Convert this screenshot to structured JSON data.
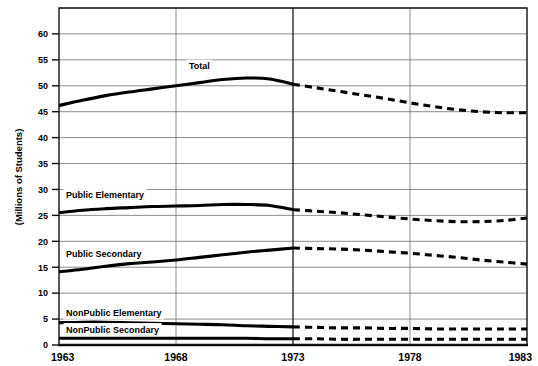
{
  "chart_data": {
    "type": "line",
    "title": "",
    "xlabel": "",
    "ylabel": "(Millions of Students)",
    "xlim": [
      1963,
      1983
    ],
    "ylim": [
      0,
      65
    ],
    "grid": true,
    "legend_position": "inline-labels",
    "x": [
      1963,
      1964,
      1965,
      1966,
      1967,
      1968,
      1969,
      1970,
      1971,
      1972,
      1973,
      1974,
      1975,
      1976,
      1977,
      1978,
      1979,
      1980,
      1981,
      1982,
      1983
    ],
    "xticks": [
      "1963",
      "1968",
      "1973",
      "1978",
      "1983"
    ],
    "yticks": [
      "0",
      "5",
      "10",
      "15",
      "20",
      "25",
      "30",
      "35",
      "40",
      "45",
      "50",
      "55",
      "60"
    ],
    "actual_range": [
      1963,
      1973
    ],
    "projected_range": [
      1973,
      1983
    ],
    "annotations": [
      {
        "text": "Total",
        "x": 1969.0,
        "y": 53.2
      },
      {
        "text": "Public Elementary",
        "x": 1963.3,
        "y": 28.3
      },
      {
        "text": "Public Secondary",
        "x": 1963.3,
        "y": 17.0
      },
      {
        "text": "NonPublic Elementary",
        "x": 1963.3,
        "y": 5.6
      },
      {
        "text": "NonPublic Secondary",
        "x": 1963.3,
        "y": 2.4
      }
    ],
    "series": [
      {
        "name": "Total",
        "values": [
          46.2,
          47.2,
          48.1,
          48.8,
          49.4,
          50.0,
          50.6,
          51.2,
          51.5,
          51.3,
          50.3,
          49.6,
          48.9,
          48.2,
          47.5,
          46.7,
          46.0,
          45.4,
          45.0,
          44.8,
          44.8
        ]
      },
      {
        "name": "Public Elementary",
        "values": [
          25.5,
          26.0,
          26.3,
          26.5,
          26.7,
          26.8,
          26.9,
          27.1,
          27.1,
          26.9,
          26.1,
          25.8,
          25.5,
          25.1,
          24.7,
          24.3,
          24.0,
          23.8,
          23.8,
          24.0,
          24.5
        ]
      },
      {
        "name": "Public Secondary",
        "values": [
          14.1,
          14.6,
          15.2,
          15.7,
          16.0,
          16.4,
          16.9,
          17.4,
          17.9,
          18.3,
          18.7,
          18.6,
          18.5,
          18.3,
          18.0,
          17.7,
          17.3,
          16.9,
          16.4,
          16.0,
          15.6
        ]
      },
      {
        "name": "NonPublic Elementary",
        "values": [
          4.3,
          4.4,
          4.4,
          4.3,
          4.2,
          4.1,
          4.0,
          3.9,
          3.7,
          3.6,
          3.5,
          3.4,
          3.3,
          3.3,
          3.2,
          3.2,
          3.1,
          3.1,
          3.1,
          3.1,
          3.1
        ]
      },
      {
        "name": "NonPublic Secondary",
        "values": [
          1.3,
          1.3,
          1.3,
          1.3,
          1.3,
          1.3,
          1.3,
          1.3,
          1.3,
          1.2,
          1.2,
          1.2,
          1.1,
          1.1,
          1.1,
          1.1,
          1.1,
          1.1,
          1.1,
          1.1,
          1.1
        ]
      }
    ]
  }
}
